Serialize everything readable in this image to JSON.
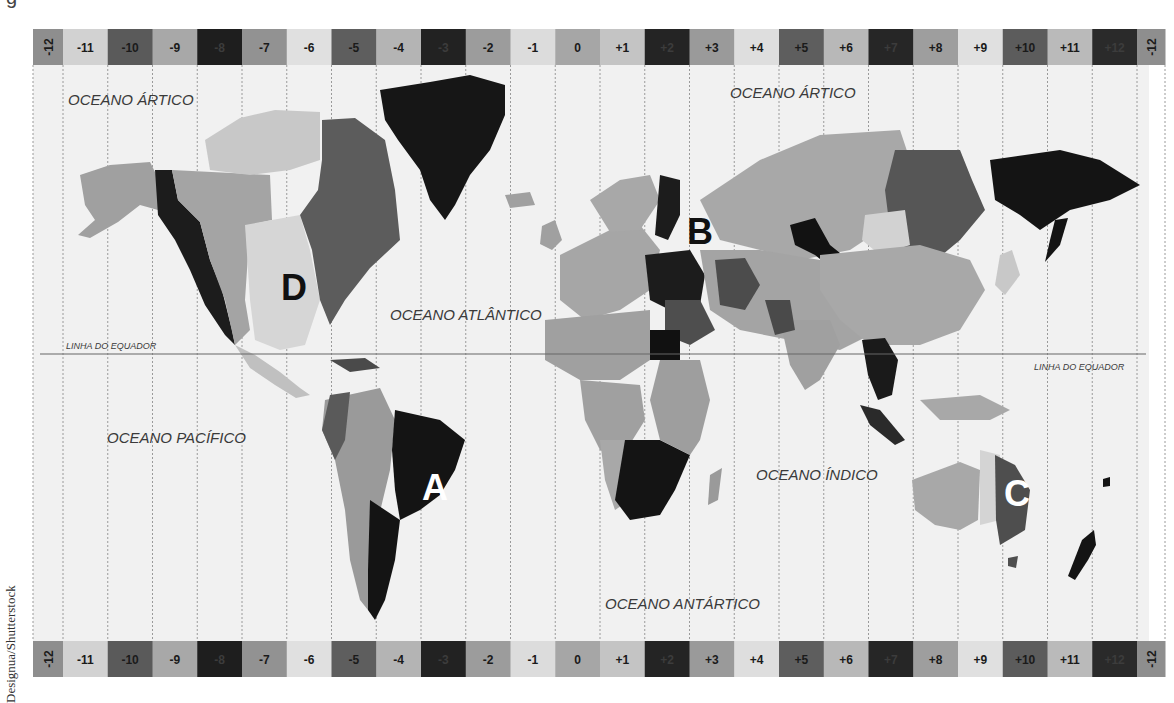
{
  "map": {
    "title_fragment": "g",
    "credit": "Designua/Shutterstock",
    "colors": {
      "ocean": "#f1f1f1",
      "zone_line": "#9a9a9a",
      "equator_line": "#666666",
      "label": "#3a3a3a",
      "marker_dark": "#111111",
      "marker_light": "#ffffff"
    },
    "band_geometry": {
      "x0": 33,
      "first_width": 30,
      "width": 44.75,
      "top_y": 29,
      "bottom_y": 641,
      "height": 36,
      "last_width": 28
    },
    "time_zones": [
      {
        "label": "-12",
        "fill": "#8e8e8e",
        "vertical": true
      },
      {
        "label": "-11",
        "fill": "#d2d2d2"
      },
      {
        "label": "-10",
        "fill": "#5a5a5a"
      },
      {
        "label": "-9",
        "fill": "#a8a8a8"
      },
      {
        "label": "-8",
        "fill": "#1e1e1e"
      },
      {
        "label": "-7",
        "fill": "#929292"
      },
      {
        "label": "-6",
        "fill": "#e0e0e0"
      },
      {
        "label": "-5",
        "fill": "#5e5e5e"
      },
      {
        "label": "-4",
        "fill": "#b4b4b4"
      },
      {
        "label": "-3",
        "fill": "#222222"
      },
      {
        "label": "-2",
        "fill": "#9c9c9c"
      },
      {
        "label": "-1",
        "fill": "#dcdcdc"
      },
      {
        "label": "0",
        "fill": "#a6a6a6"
      },
      {
        "label": "+1",
        "fill": "#c4c4c4"
      },
      {
        "label": "+2",
        "fill": "#242424"
      },
      {
        "label": "+3",
        "fill": "#9a9a9a"
      },
      {
        "label": "+4",
        "fill": "#dedede"
      },
      {
        "label": "+5",
        "fill": "#5e5e5e"
      },
      {
        "label": "+6",
        "fill": "#b8b8b8"
      },
      {
        "label": "+7",
        "fill": "#262626"
      },
      {
        "label": "+8",
        "fill": "#9e9e9e"
      },
      {
        "label": "+9",
        "fill": "#e0e0e0"
      },
      {
        "label": "+10",
        "fill": "#5c5c5c"
      },
      {
        "label": "+11",
        "fill": "#bababa"
      },
      {
        "label": "+12",
        "fill": "#2a2a2a"
      },
      {
        "label": "-12",
        "fill": "#8e8e8e",
        "vertical": true
      }
    ],
    "equator": {
      "label": "LINHA DO EQUADOR",
      "y": 354,
      "x1": 40,
      "x2": 1146
    },
    "ocean_labels": [
      {
        "id": "arctic-west",
        "text": "OCEANO ÁRTICO",
        "x": 68,
        "y": 105,
        "size": 15
      },
      {
        "id": "arctic-east",
        "text": "OCEANO ÁRTICO",
        "x": 730,
        "y": 98,
        "size": 15
      },
      {
        "id": "atlantic",
        "text": "OCEANO ATLÂNTICO",
        "x": 390,
        "y": 320,
        "size": 15
      },
      {
        "id": "pacific",
        "text": "OCEANO PACÍFICO",
        "x": 107,
        "y": 443,
        "size": 15
      },
      {
        "id": "indian",
        "text": "OCEANO ÍNDICO",
        "x": 756,
        "y": 480,
        "size": 15
      },
      {
        "id": "antarctic",
        "text": "OCEANO ANTÁRTICO",
        "x": 605,
        "y": 609,
        "size": 15
      }
    ],
    "equator_labels": [
      {
        "id": "equator-west",
        "text": "LINHA DO EQUADOR",
        "x": 66,
        "y": 349
      },
      {
        "id": "equator-east",
        "text": "LINHA DO EQUADOR",
        "x": 1034,
        "y": 370
      }
    ],
    "markers": [
      {
        "letter": "A",
        "x": 435,
        "y": 500,
        "color": "#ffffff"
      },
      {
        "letter": "B",
        "x": 700,
        "y": 244,
        "color": "#111111"
      },
      {
        "letter": "C",
        "x": 1017,
        "y": 506,
        "color": "#ffffff"
      },
      {
        "letter": "D",
        "x": 294,
        "y": 300,
        "color": "#111111"
      }
    ],
    "land": [
      {
        "name": "alaska",
        "fill": "#a0a0a0",
        "d": "M80,175 L110,165 L150,162 L158,178 L158,210 L140,205 L118,222 L90,238 L78,235 L95,220 L85,205 Z"
      },
      {
        "name": "canada-pacific",
        "fill": "#1c1c1c",
        "d": "M155,170 L172,170 L178,200 L200,222 L210,260 L222,290 L232,330 L235,345 L225,335 L205,305 L190,270 L175,240 L158,215 Z"
      },
      {
        "name": "canada-mountain",
        "fill": "#a4a4a4",
        "d": "M172,170 L270,175 L272,220 L250,225 L245,300 L250,330 L235,345 L225,300 L210,260 L200,222 L178,200 Z"
      },
      {
        "name": "canada-central",
        "fill": "#d6d6d6",
        "d": "M245,225 L300,215 L310,250 L320,300 L305,345 L280,350 L255,340 L250,300 Z"
      },
      {
        "name": "arctic-islands-west",
        "fill": "#c8c8c8",
        "d": "M205,140 L240,118 L275,110 L320,112 L320,160 L290,170 L250,175 L210,170 Z"
      },
      {
        "name": "canada-east",
        "fill": "#5c5c5c",
        "d": "M322,120 L355,118 L385,140 L395,190 L400,240 L370,268 L345,300 L330,325 L320,300 L312,250 L300,215 L318,190 L322,160 Z"
      },
      {
        "name": "greenland",
        "fill": "#161616",
        "d": "M380,90 L430,82 L470,75 L505,85 L505,115 L490,150 L470,175 L455,205 L445,220 L430,200 L420,170 L398,140 L385,120 Z"
      },
      {
        "name": "central-america",
        "fill": "#c0c0c0",
        "d": "M235,345 L255,355 L280,372 L300,388 L310,395 L296,398 L275,385 L250,368 Z"
      },
      {
        "name": "caribbean",
        "fill": "#4a4a4a",
        "d": "M330,360 L365,358 L380,368 L350,372 Z"
      },
      {
        "name": "south-america-west",
        "fill": "#9a9a9a",
        "d": "M325,400 L380,388 L395,420 L390,470 L378,520 L368,570 L368,610 L360,600 L350,560 L345,510 L335,460 L322,430 Z"
      },
      {
        "name": "south-america-north",
        "fill": "#5a5a5a",
        "d": "M330,395 L350,392 L345,440 L335,460 L322,430 Z"
      },
      {
        "name": "brazil",
        "fill": "#141414",
        "d": "M395,410 L440,420 L465,440 L455,470 L440,495 L420,510 L400,520 L395,490 L392,450 Z"
      },
      {
        "name": "south-america-south",
        "fill": "#141414",
        "d": "M370,500 L400,520 L395,560 L385,600 L375,620 L368,610 L368,570 Z"
      },
      {
        "name": "iceland",
        "fill": "#a0a0a0",
        "d": "M505,195 L530,192 L535,205 L510,208 Z"
      },
      {
        "name": "uk",
        "fill": "#a0a0a0",
        "d": "M542,226 L555,220 L562,240 L552,250 L540,244 Z"
      },
      {
        "name": "europe-west",
        "fill": "#a6a6a6",
        "d": "M560,255 L610,230 L640,225 L660,250 L650,290 L620,310 L585,320 L560,300 Z"
      },
      {
        "name": "scandinavia",
        "fill": "#a8a8a8",
        "d": "M590,200 L620,180 L650,175 L660,200 L640,230 L610,232 Z"
      },
      {
        "name": "finland-east-europe",
        "fill": "#1c1c1c",
        "d": "M660,175 L680,180 L680,215 L668,240 L655,235 Z"
      },
      {
        "name": "turkey-eastern-europe",
        "fill": "#1c1c1c",
        "d": "M645,255 L690,250 L705,275 L700,305 L670,310 L650,300 Z"
      },
      {
        "name": "middle-east",
        "fill": "#4e4e4e",
        "d": "M665,300 L700,300 L715,330 L690,345 L665,335 Z"
      },
      {
        "name": "egypt",
        "fill": "#111111",
        "d": "M650,330 L680,330 L680,360 L650,360 Z"
      },
      {
        "name": "north-africa",
        "fill": "#a0a0a0",
        "d": "M545,320 L650,310 L650,360 L620,380 L580,380 L545,360 Z"
      },
      {
        "name": "west-africa",
        "fill": "#a0a0a0",
        "d": "M580,380 L640,385 L645,420 L620,460 L600,450 L585,420 Z"
      },
      {
        "name": "central-africa-west",
        "fill": "#a8a8a8",
        "d": "M600,440 L625,440 L630,500 L615,510 L605,480 Z"
      },
      {
        "name": "southern-africa",
        "fill": "#141414",
        "d": "M625,440 L660,440 L690,455 L675,490 L660,515 L630,520 L615,500 Z"
      },
      {
        "name": "east-africa",
        "fill": "#9e9e9e",
        "d": "M660,360 L700,360 L710,400 L700,440 L690,455 L660,440 L650,400 Z"
      },
      {
        "name": "madagascar",
        "fill": "#9a9a9a",
        "d": "M710,475 L722,468 L718,500 L708,505 Z"
      },
      {
        "name": "russia-main",
        "fill": "#a8a8a8",
        "d": "M700,200 L760,160 L820,135 L900,130 L910,160 L900,200 L880,230 L850,250 L800,260 L760,250 L720,240 Z"
      },
      {
        "name": "central-asia",
        "fill": "#a4a4a4",
        "d": "M700,250 L760,250 L820,260 L860,300 L880,330 L840,350 L790,340 L740,330 L710,310 Z"
      },
      {
        "name": "kazakhstan-dark",
        "fill": "#4c4c4c",
        "d": "M715,260 L745,258 L760,285 L745,310 L720,305 Z"
      },
      {
        "name": "russia-omsk",
        "fill": "#121212",
        "d": "M790,225 L815,218 L830,245 L855,265 L840,275 L815,255 L795,245 Z"
      },
      {
        "name": "russia-yakutsk",
        "fill": "#565656",
        "d": "M895,150 L960,150 L972,180 L985,210 L960,240 L930,265 L900,260 L890,230 L885,190 Z"
      },
      {
        "name": "mongolia-light",
        "fill": "#d2d2d2",
        "d": "M865,215 L905,210 L910,245 L880,255 L862,240 Z"
      },
      {
        "name": "russia-far-east",
        "fill": "#141414",
        "d": "M990,160 L1060,150 L1100,160 L1140,185 L1110,200 L1070,210 L1040,230 L1020,215 L995,200 Z"
      },
      {
        "name": "kamchatka",
        "fill": "#141414",
        "d": "M1055,220 L1068,218 L1060,245 L1045,262 L1050,240 Z"
      },
      {
        "name": "china",
        "fill": "#a8a8a8",
        "d": "M820,255 L920,245 L970,260 L985,290 L960,330 L920,345 L870,345 L840,320 L820,290 Z"
      },
      {
        "name": "india",
        "fill": "#a0a0a0",
        "d": "M780,320 L830,320 L840,345 L820,380 L805,390 L790,365 Z"
      },
      {
        "name": "pakistan",
        "fill": "#4a4a4a",
        "d": "M765,300 L790,300 L795,330 L775,335 Z"
      },
      {
        "name": "japan",
        "fill": "#c8c8c8",
        "d": "M1000,255 L1012,250 L1020,275 L1005,295 L995,285 Z"
      },
      {
        "name": "southeast-asia",
        "fill": "#1a1a1a",
        "d": "M862,340 L885,338 L898,360 L892,395 L878,400 L868,375 Z"
      },
      {
        "name": "indonesia-west",
        "fill": "#2a2a2a",
        "d": "M860,405 L880,410 L905,440 L895,445 L870,425 Z"
      },
      {
        "name": "indonesia-east",
        "fill": "#a8a8a8",
        "d": "M920,400 L980,395 L1010,410 L990,420 L940,420 Z"
      },
      {
        "name": "australia-west",
        "fill": "#a8a8a8",
        "d": "M912,480 L960,462 L980,470 L978,520 L960,530 L935,525 L915,510 Z"
      },
      {
        "name": "australia-central",
        "fill": "#d4d4d4",
        "d": "M980,450 L1000,455 L1000,520 L980,525 Z"
      },
      {
        "name": "australia-east",
        "fill": "#4e4e4e",
        "d": "M995,455 L1015,465 L1030,490 L1025,530 L1000,545 L996,520 Z"
      },
      {
        "name": "tasmania",
        "fill": "#4e4e4e",
        "d": "M1008,558 L1018,556 L1016,568 L1008,566 Z"
      },
      {
        "name": "new-zealand",
        "fill": "#141414",
        "d": "M1082,540 L1094,530 L1096,545 L1088,560 L1075,580 L1068,576 Z"
      },
      {
        "name": "fiji",
        "fill": "#141414",
        "d": "M1103,479 L1110,477 L1110,486 L1103,487 Z"
      }
    ]
  }
}
